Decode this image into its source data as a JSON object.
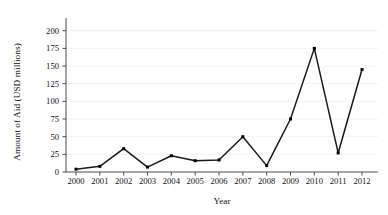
{
  "chart_data": {
    "type": "line",
    "title": "",
    "xlabel": "Year",
    "ylabel": "Amount of Aid (USD millions)",
    "categories": [
      "2000",
      "2001",
      "2002",
      "2003",
      "2004",
      "2005",
      "2006",
      "2007",
      "2008",
      "2009",
      "2010",
      "2011",
      "2012"
    ],
    "values": [
      4,
      8,
      33,
      7,
      23,
      16,
      17,
      50,
      9,
      75,
      175,
      27,
      145
    ],
    "series": [
      {
        "name": "Amount of Aid",
        "values": [
          4,
          8,
          33,
          7,
          23,
          16,
          17,
          50,
          9,
          75,
          175,
          27,
          145
        ]
      }
    ],
    "ylim": [
      0,
      218
    ],
    "yticks": [
      0,
      25,
      50,
      75,
      100,
      125,
      150,
      175,
      200
    ],
    "ytick_labels": [
      "0",
      "25",
      "50",
      "75",
      "100",
      "125",
      "150",
      "175",
      "200"
    ],
    "xtick_labels": [
      "2000",
      "2001",
      "2002",
      "2003",
      "2004",
      "2005",
      "2006",
      "2007",
      "2008",
      "2009",
      "2010",
      "2011",
      "2012"
    ],
    "grid": true,
    "grid_color": "#f2f2f2",
    "legend": false,
    "legend_position": "none",
    "line_color": "#1a1a1a",
    "marker": "square",
    "marker_color": "#000000",
    "axis_color": "#4d4d4d",
    "background_color": "#ffffff"
  }
}
